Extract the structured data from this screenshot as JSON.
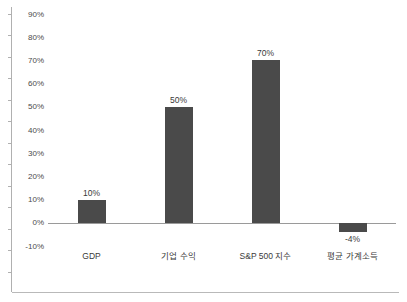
{
  "chart_data": {
    "type": "bar",
    "title": "",
    "subtitle": "",
    "xlabel": "",
    "ylabel": "",
    "categories": [
      "GDP",
      "기업 수익",
      "S&P 500 지수",
      "평균 가계소득"
    ],
    "values": [
      10,
      50,
      70,
      -4
    ],
    "value_labels": [
      "10%",
      "50%",
      "70%",
      "-4%"
    ],
    "ylim": [
      -10,
      90
    ],
    "ytick_values": [
      90,
      80,
      70,
      60,
      50,
      40,
      30,
      20,
      10,
      0,
      -10
    ],
    "ytick_labels": [
      "90%",
      "80%",
      "70%",
      "60%",
      "50%",
      "40%",
      "30%",
      "20%",
      "10%",
      "0%",
      "-10%"
    ],
    "grid": false,
    "legend": null,
    "bar_color": "#4a4a4a",
    "axis_color": "#9a9a9a",
    "frame_color": "#b9b9b9",
    "text_color": "#3a3a3a"
  }
}
